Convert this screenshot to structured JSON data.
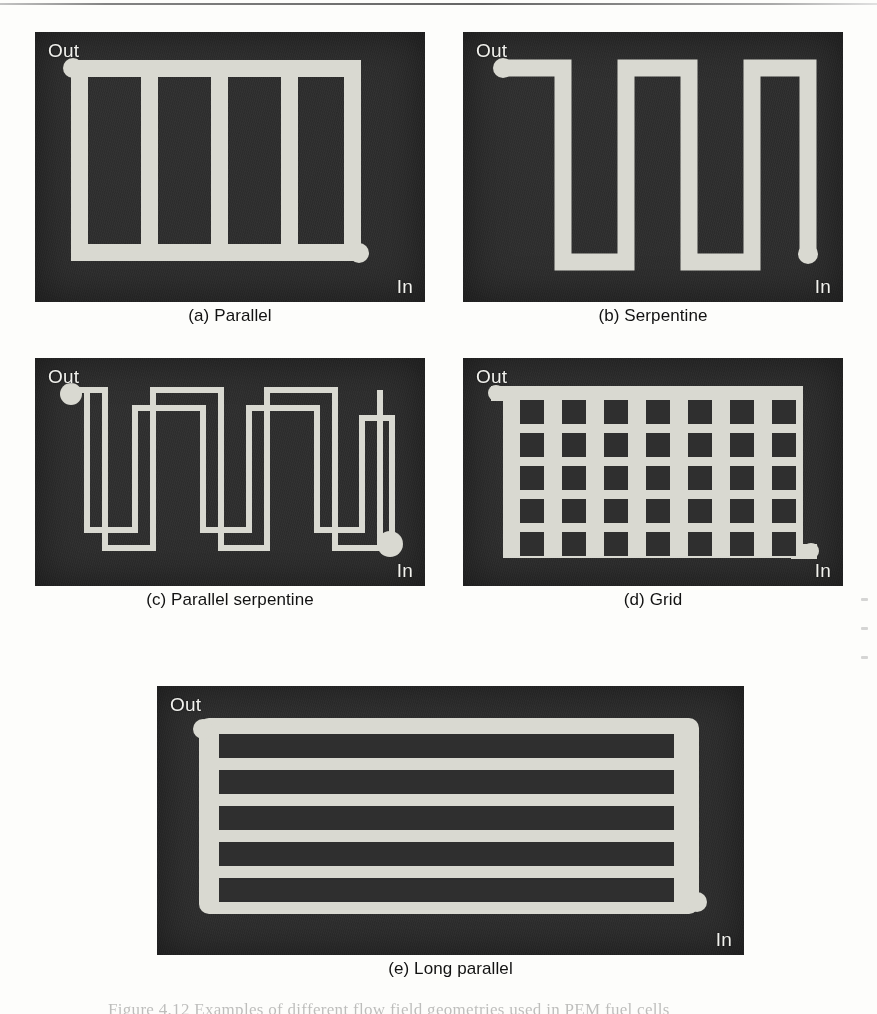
{
  "figure": {
    "caption_partial": "Figure 4.12   Examples of different flow field geometries used in PEM fuel cells",
    "port_out": "Out",
    "port_in": "In",
    "colors": {
      "plate_dark": "#2f2f2f",
      "channel_light": "#d9d9d1",
      "page_background": "#fdfdfb",
      "label_text": "#f2f2ee",
      "caption_text": "#121212"
    }
  },
  "panels": [
    {
      "id": "a",
      "caption": "(a) Parallel",
      "type": "parallel",
      "out_label": "Out",
      "in_label": "In",
      "channel_count": 5,
      "rib_count": 4,
      "description": "Top and bottom manifolds joined by five straight vertical channels"
    },
    {
      "id": "b",
      "caption": "(b) Serpentine",
      "type": "serpentine",
      "out_label": "Out",
      "in_label": "In",
      "vertical_legs": 5,
      "turns": 4,
      "description": "Single continuous channel folding back and forth"
    },
    {
      "id": "c",
      "caption": "(c) Parallel serpentine",
      "type": "parallel-serpentine",
      "out_label": "Out",
      "in_label": "In",
      "parallel_paths": 2,
      "vertical_legs": 5,
      "description": "Two interleaved serpentine channels running in parallel"
    },
    {
      "id": "d",
      "caption": "(d) Grid",
      "type": "grid",
      "out_label": "Out",
      "in_label": "In",
      "grid_columns": 7,
      "grid_rows": 5,
      "description": "Open mesh field with a seven by five array of square lands"
    },
    {
      "id": "e",
      "caption": "(e) Long parallel",
      "type": "long-parallel",
      "out_label": "Out",
      "in_label": "In",
      "channel_count": 6,
      "rib_count": 5,
      "description": "Wide plate with six long horizontal parallel channels"
    }
  ]
}
